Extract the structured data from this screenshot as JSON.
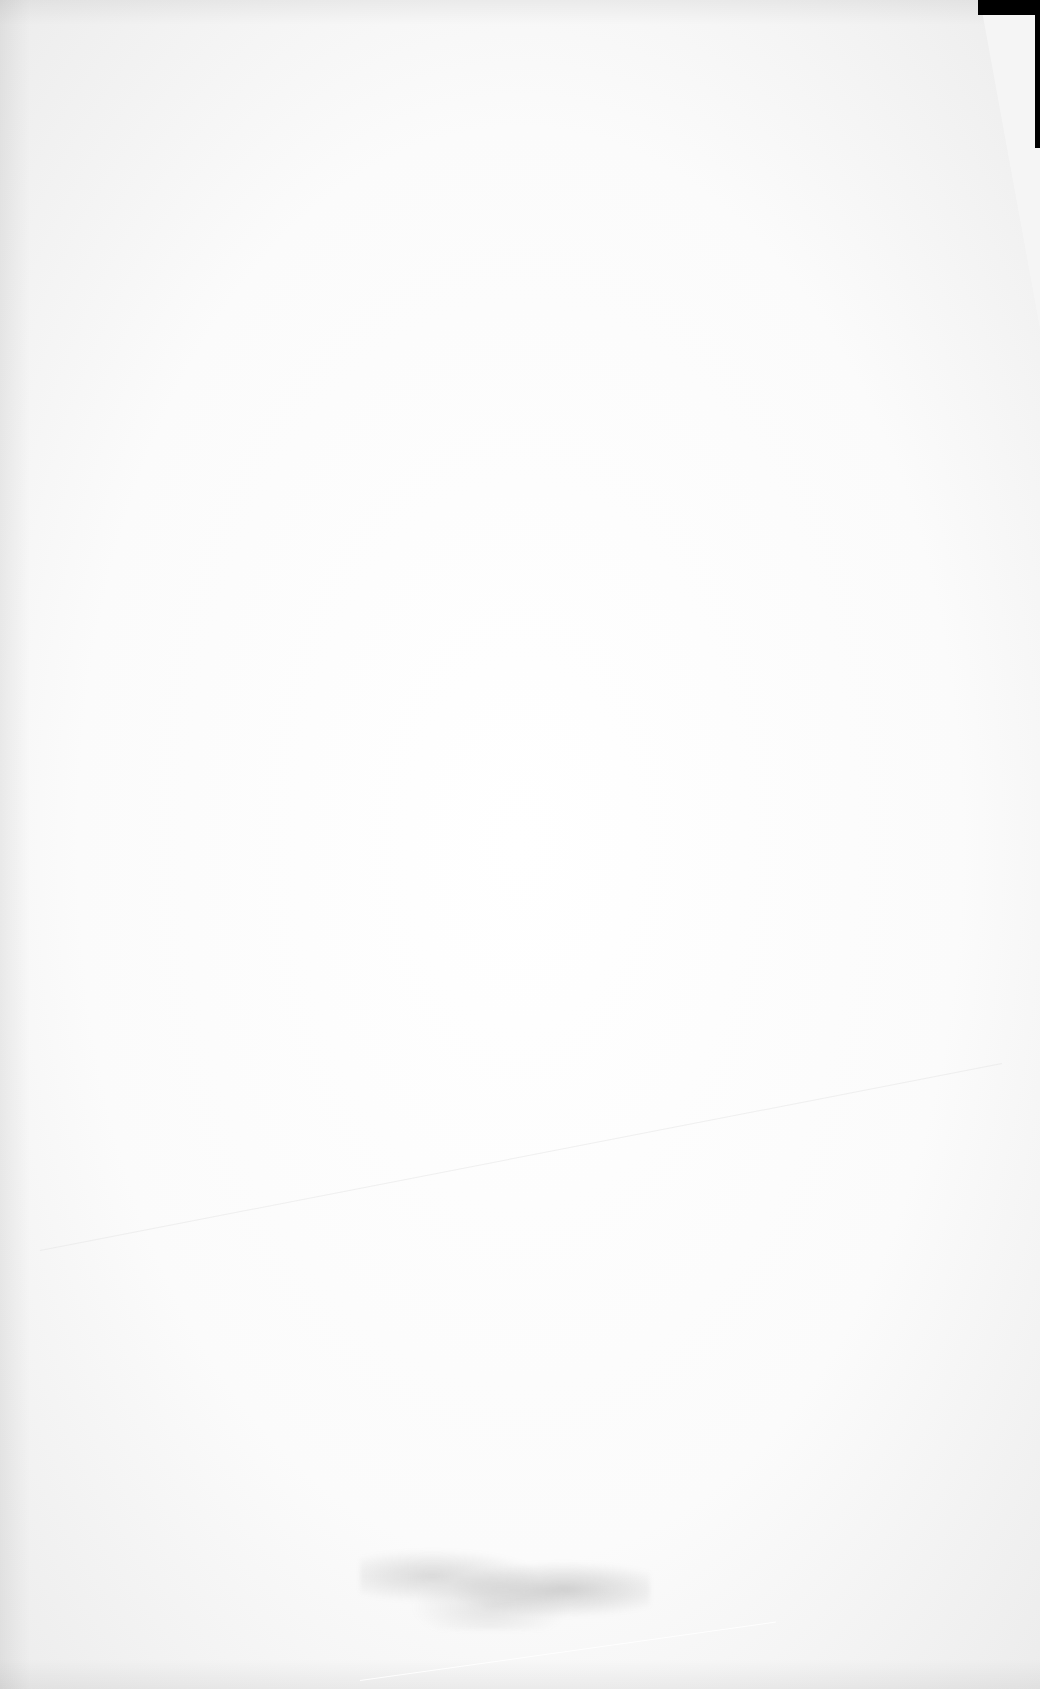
{
  "document": {
    "type": "scanned-page",
    "content_text": "",
    "legible_text_present": false
  },
  "colors": {
    "paper": "#ffffff",
    "background": "#f4f4f4",
    "scanner_edge": "#000000",
    "smudge": "#8a8a8a"
  }
}
